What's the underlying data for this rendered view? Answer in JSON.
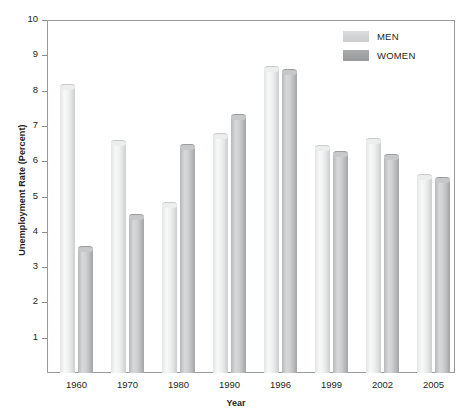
{
  "chart_data": {
    "type": "bar",
    "title": "",
    "xlabel": "Year",
    "ylabel": "Unemployment Rate (Percent)",
    "categories": [
      "1960",
      "1970",
      "1980",
      "1990",
      "1996",
      "1999",
      "2002",
      "2005"
    ],
    "series": [
      {
        "name": "MEN",
        "color": "#d9dadb",
        "values": [
          8.2,
          6.6,
          4.85,
          6.8,
          8.7,
          6.45,
          6.65,
          5.65
        ]
      },
      {
        "name": "WOMEN",
        "color": "#a3a5a6",
        "values": [
          3.6,
          4.5,
          6.5,
          7.35,
          8.6,
          6.3,
          6.2,
          5.55
        ]
      }
    ],
    "ylim": [
      0,
      10
    ],
    "yticks": [
      "1",
      "2",
      "3",
      "4",
      "5",
      "6",
      "7",
      "8",
      "9",
      "10"
    ],
    "grid": false,
    "legend_position": "top-right"
  },
  "legend": {
    "entries": [
      {
        "label": "MEN"
      },
      {
        "label": "WOMEN"
      }
    ]
  },
  "axes": {
    "y_title": "Unemployment Rate (Percent)",
    "x_title": "Year"
  }
}
